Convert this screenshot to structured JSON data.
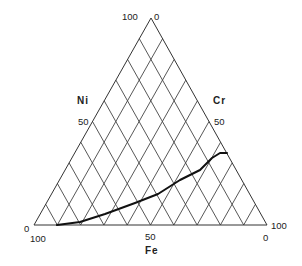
{
  "chart_data": {
    "type": "ternary",
    "title": "",
    "axes": {
      "bottom": {
        "name": "Fe",
        "ticks": [
          "100",
          "50",
          "0"
        ]
      },
      "left": {
        "name": "Ni",
        "ticks": [
          "0",
          "50",
          "100"
        ]
      },
      "right": {
        "name": "Cr",
        "ticks": [
          "0",
          "50",
          "100"
        ]
      }
    },
    "grid": {
      "on": true,
      "interval_percent": 10,
      "families": [
        "parallel-to-left-edge",
        "parallel-to-right-edge"
      ]
    },
    "series": [
      {
        "name": "boundary-curve",
        "points_fe_ni_cr": [
          [
            90,
            0,
            10
          ],
          [
            84,
            1,
            15
          ],
          [
            73,
            4,
            23
          ],
          [
            60,
            8,
            32
          ],
          [
            50,
            12,
            38
          ],
          [
            40,
            17,
            43
          ],
          [
            31,
            22,
            47
          ],
          [
            26,
            26,
            48
          ],
          [
            23,
            29,
            48
          ],
          [
            20,
            30,
            50
          ]
        ]
      }
    ]
  },
  "labels": {
    "top_left": "100",
    "top_right": "0",
    "left_name": "Ni",
    "left_mid": "50",
    "right_name": "Cr",
    "right_mid": "50",
    "bottom_left_zero": "0",
    "bottom_left_hundred": "100",
    "bottom_right_hundred": "100",
    "bottom_right_zero": "0",
    "bottom_mid": "50",
    "bottom_name": "Fe"
  },
  "geometry": {
    "left": [
      34,
      225
    ],
    "right": [
      267,
      225
    ],
    "top": [
      151,
      18
    ],
    "curve_px": [
      [
        57,
        225
      ],
      [
        80,
        222
      ],
      [
        105,
        214
      ],
      [
        135,
        203
      ],
      [
        158,
        194
      ],
      [
        180,
        180
      ],
      [
        200,
        170
      ],
      [
        212,
        158
      ],
      [
        220,
        153
      ],
      [
        227,
        153
      ]
    ]
  }
}
